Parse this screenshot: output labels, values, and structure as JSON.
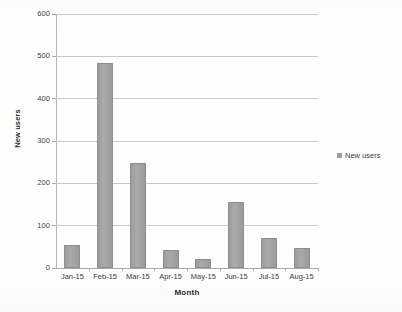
{
  "chart_data": {
    "type": "bar",
    "title": "",
    "categories": [
      "Jan-15",
      "Feb-15",
      "Mar-15",
      "Apr-15",
      "May-15",
      "Jun-15",
      "Jul-15",
      "Aug-15"
    ],
    "values": [
      54,
      485,
      248,
      42,
      22,
      157,
      71,
      48
    ],
    "series": [
      {
        "name": "New users",
        "values": [
          54,
          485,
          248,
          42,
          22,
          157,
          71,
          48
        ],
        "color": "#9e9e9e"
      }
    ],
    "xlabel": "Month",
    "ylabel": "New users",
    "ylim": [
      0,
      600
    ],
    "yticks": [
      0,
      100,
      200,
      300,
      400,
      500,
      600
    ],
    "ytick_labels": [
      "0",
      "100",
      "200",
      "300",
      "400",
      "500",
      "600"
    ],
    "grid": true,
    "grid_axis": "y",
    "legend": {
      "position": "right",
      "entries": [
        {
          "label": "New users",
          "color": "#9e9e9e"
        }
      ]
    }
  }
}
